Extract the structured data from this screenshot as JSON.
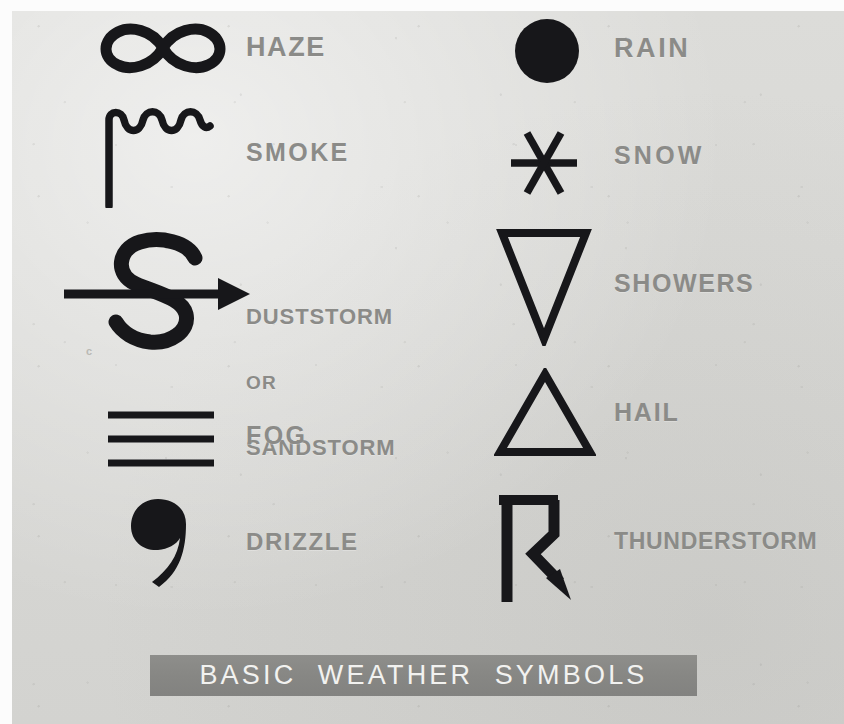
{
  "poster": {
    "title": "BASIC  WEATHER  SYMBOLS",
    "background_color": "#d8d8d5",
    "symbol_color": "#17171a",
    "label_color": "#8b8b88",
    "banner_color": "#888885",
    "banner_text_color": "#f2f2f0"
  },
  "columns": {
    "left": [
      {
        "icon": "infinity-symbol",
        "label": "HAZE"
      },
      {
        "icon": "smoke-plume-symbol",
        "label": "SMOKE"
      },
      {
        "icon": "duststorm-s-arrow-symbol",
        "label_line1": "DUSTSTORM",
        "label_line2": "OR",
        "label_line3": "SANDSTORM"
      },
      {
        "icon": "fog-three-bars-symbol",
        "label": "FOG"
      },
      {
        "icon": "drizzle-comma-symbol",
        "label": "DRIZZLE"
      }
    ],
    "right": [
      {
        "icon": "rain-filled-circle-symbol",
        "label": "RAIN"
      },
      {
        "icon": "snow-asterisk-symbol",
        "label": "SNOW"
      },
      {
        "icon": "showers-down-triangle-symbol",
        "label": "SHOWERS"
      },
      {
        "icon": "hail-up-triangle-symbol",
        "label": "HAIL"
      },
      {
        "icon": "thunderstorm-lightning-symbol",
        "label": "THUNDERSTORM"
      }
    ]
  }
}
